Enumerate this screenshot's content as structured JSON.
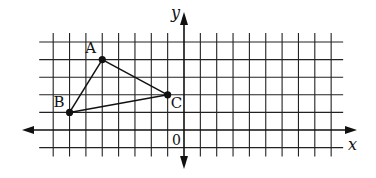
{
  "diagram": {
    "type": "coordinate-grid-triangle",
    "colors": {
      "grid": "#222222",
      "axis": "#111111",
      "line": "#111111",
      "point": "#111111",
      "background": "#ffffff"
    },
    "grid": {
      "x_min": -8,
      "x_max": 9,
      "y_min": -1,
      "y_max": 5,
      "origin_px": [
        184,
        130
      ],
      "unit_px_x": 16.35,
      "unit_px_y": 17.6
    },
    "axes": {
      "x_label": "x",
      "y_label": "y",
      "origin_label": "0"
    },
    "points": [
      {
        "name": "A",
        "x": -5,
        "y": 4
      },
      {
        "name": "B",
        "x": -7,
        "y": 1
      },
      {
        "name": "C",
        "x": -1,
        "y": 2
      }
    ],
    "segments": [
      [
        "A",
        "B"
      ],
      [
        "B",
        "C"
      ],
      [
        "C",
        "A"
      ]
    ]
  }
}
